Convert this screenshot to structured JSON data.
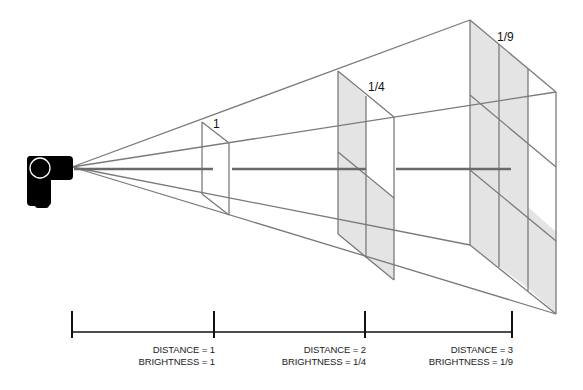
{
  "diagram": {
    "source_icon": "flash-light-icon",
    "colors": {
      "line": "#7a7a7a",
      "panel_fill": "#e4e4e4",
      "axis": "#111111",
      "source": "#000000"
    },
    "panels": [
      {
        "label": "1"
      },
      {
        "label": "1/4"
      },
      {
        "label": "1/9"
      }
    ],
    "axis": {
      "ticks": [
        {
          "distance": "DISTANCE = 1",
          "brightness": "BRIGHTNESS = 1"
        },
        {
          "distance": "DISTANCE = 2",
          "brightness": "BRIGHTNESS = 1/4"
        },
        {
          "distance": "DISTANCE = 3",
          "brightness": "BRIGHTNESS = 1/9"
        }
      ]
    }
  }
}
